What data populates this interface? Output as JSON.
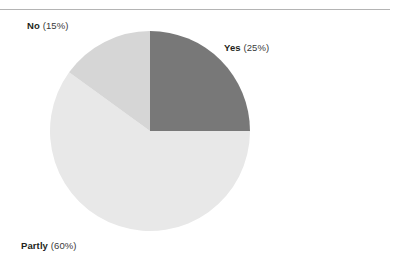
{
  "figure": {
    "has_top_rule": true,
    "background_color": "#ffffff"
  },
  "chart_data": {
    "type": "pie",
    "title": "",
    "subtitle": "",
    "xlabel": "",
    "ylabel": "",
    "legend_position": "none",
    "grid": false,
    "units": "percent",
    "total": 100,
    "start_angle_deg": 0,
    "direction": "clockwise",
    "categories": [
      "Yes",
      "Partly",
      "No"
    ],
    "values": [
      25,
      60,
      15
    ],
    "colors": [
      "#787878",
      "#e8e8e8",
      "#d6d6d6"
    ],
    "slices": [
      {
        "name": "Yes",
        "value": 25,
        "value_text": "(25%)",
        "color": "#787878",
        "start_angle_deg": 0,
        "end_angle_deg": 90,
        "label_text": "Yes (25%)"
      },
      {
        "name": "Partly",
        "value": 60,
        "value_text": "(60%)",
        "color": "#e8e8e8",
        "start_angle_deg": 90,
        "end_angle_deg": 306,
        "label_text": "Partly (60%)"
      },
      {
        "name": "No",
        "value": 15,
        "value_text": "(15%)",
        "color": "#d6d6d6",
        "start_angle_deg": 306,
        "end_angle_deg": 360,
        "label_text": "No (15%)"
      }
    ],
    "geometry": {
      "center_x": 150,
      "center_y": 131,
      "radius": 100
    }
  },
  "labels": {
    "yes": {
      "name": "Yes",
      "value": "(25%)"
    },
    "partly": {
      "name": "Partly",
      "value": "(60%)"
    },
    "no": {
      "name": "No",
      "value": "(15%)"
    }
  }
}
